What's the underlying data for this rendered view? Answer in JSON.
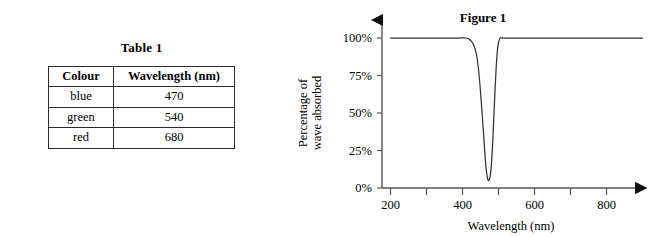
{
  "table_panel": {
    "title": "Table 1",
    "columns": [
      "Colour",
      "Wavelength (nm)"
    ],
    "rows": [
      {
        "colour": "blue",
        "wavelength": "470"
      },
      {
        "colour": "green",
        "wavelength": "540"
      },
      {
        "colour": "red",
        "wavelength": "680"
      }
    ]
  },
  "figure_panel": {
    "title": "Figure 1"
  },
  "chart_data": {
    "type": "line",
    "title": "Figure 1",
    "xlabel": "Wavelength (nm)",
    "ylabel": "Percentage of wave absorbed",
    "ylabel_lines": [
      "Percentage of",
      "wave absorbed"
    ],
    "xlim": [
      200,
      900
    ],
    "ylim": [
      0,
      100
    ],
    "grid": false,
    "legend": null,
    "xticks": [
      200,
      300,
      400,
      500,
      600,
      700,
      800
    ],
    "xtick_labels": [
      "200",
      "",
      "400",
      "",
      "600",
      "",
      "800"
    ],
    "yticks": [
      0,
      25,
      50,
      75,
      100
    ],
    "ytick_labels": [
      "0%",
      "25%",
      "50%",
      "75%",
      "100%"
    ],
    "series": [
      {
        "name": "absorption",
        "color": "#333333",
        "x": [
          200,
          250,
          300,
          350,
          390,
          410,
          420,
          430,
          438,
          445,
          452,
          458,
          463,
          467,
          470,
          473,
          477,
          481,
          485,
          489,
          493,
          497,
          500,
          505,
          515,
          540,
          600,
          700,
          800,
          900
        ],
        "y": [
          100,
          100,
          100,
          100,
          100,
          100,
          99,
          96,
          90,
          78,
          58,
          38,
          20,
          10,
          6,
          5,
          8,
          18,
          36,
          58,
          78,
          92,
          97,
          100,
          100,
          100,
          100,
          100,
          100,
          100
        ]
      }
    ],
    "annotations": {
      "trough_center_nm": 470,
      "trough_min_percent": 5
    }
  }
}
